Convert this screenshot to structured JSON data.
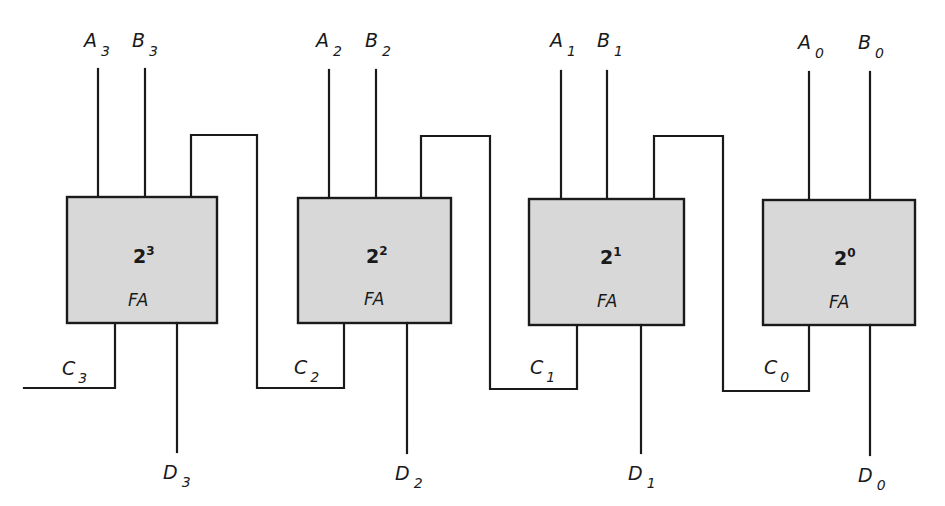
{
  "diagram": {
    "colors": {
      "line": "#1a1a1a",
      "box_fill": "#d8d8d8",
      "background": "#ffffff"
    },
    "adders": [
      {
        "id": "fa3",
        "weight_base": "2",
        "weight_exp": "3",
        "type_label": "FA",
        "box": {
          "x": 67,
          "y": 197,
          "w": 150,
          "h": 126
        },
        "input_a": {
          "name": "A",
          "index": "3",
          "x": 98
        },
        "input_b": {
          "name": "B",
          "index": "3",
          "x": 145
        },
        "carry_in_x": 191,
        "carry_out": {
          "name": "C",
          "index": "3",
          "x": 115
        },
        "sum_out": {
          "name": "D",
          "index": "3",
          "x": 177
        }
      },
      {
        "id": "fa2",
        "weight_base": "2",
        "weight_exp": "2",
        "type_label": "FA",
        "box": {
          "x": 298,
          "y": 198,
          "w": 153,
          "h": 125
        },
        "input_a": {
          "name": "A",
          "index": "2",
          "x": 329
        },
        "input_b": {
          "name": "B",
          "index": "2",
          "x": 376
        },
        "carry_in_x": 421,
        "carry_out": {
          "name": "C",
          "index": "2",
          "x": 344
        },
        "sum_out": {
          "name": "D",
          "index": "2",
          "x": 407
        }
      },
      {
        "id": "fa1",
        "weight_base": "2",
        "weight_exp": "1",
        "type_label": "FA",
        "box": {
          "x": 529,
          "y": 199,
          "w": 155,
          "h": 126
        },
        "input_a": {
          "name": "A",
          "index": "1",
          "x": 561
        },
        "input_b": {
          "name": "B",
          "index": "1",
          "x": 607
        },
        "carry_in_x": 654,
        "carry_out": {
          "name": "C",
          "index": "1",
          "x": 577
        },
        "sum_out": {
          "name": "D",
          "index": "1",
          "x": 641
        }
      },
      {
        "id": "fa0",
        "weight_base": "2",
        "weight_exp": "0",
        "type_label": "FA",
        "box": {
          "x": 763,
          "y": 200,
          "w": 152,
          "h": 125
        },
        "input_a": {
          "name": "A",
          "index": "0",
          "x": 809
        },
        "input_b": {
          "name": "B",
          "index": "0",
          "x": 870
        },
        "carry_in_x": null,
        "carry_out": {
          "name": "C",
          "index": "0",
          "x": 809
        },
        "sum_out": {
          "name": "D",
          "index": "0",
          "x": 870
        }
      }
    ],
    "final_carry_label": "C3"
  }
}
